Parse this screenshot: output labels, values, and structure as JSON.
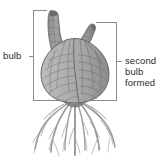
{
  "diagram": {
    "subject": "bulb",
    "labels": {
      "left": {
        "text": "bulb"
      },
      "right": {
        "line1": "second",
        "line2": "bulb",
        "line3": "formed"
      }
    },
    "colors": {
      "background": "#ffffff",
      "bulb_light": "#b3b3b3",
      "bulb_mid": "#a3a3a3",
      "bulb_dark": "#8f8f8f",
      "neck_dark": "#6f6f6f",
      "outline": "#5a5a5a",
      "root": "#9a9a9a",
      "bracket": "#8c8c8c",
      "text": "#2b2b2b"
    },
    "parts": {
      "first_neck": "first-bulb-neck",
      "second_neck": "second-bulb-neck",
      "bulb_body": "bulb-body",
      "basal_plate": "basal-plate",
      "roots": "root-system",
      "scale_lines": "bulb-scale-lines"
    },
    "brackets": {
      "left_bracket": "bulb-extent-bracket",
      "right_bracket": "second-bulb-extent-bracket"
    }
  }
}
